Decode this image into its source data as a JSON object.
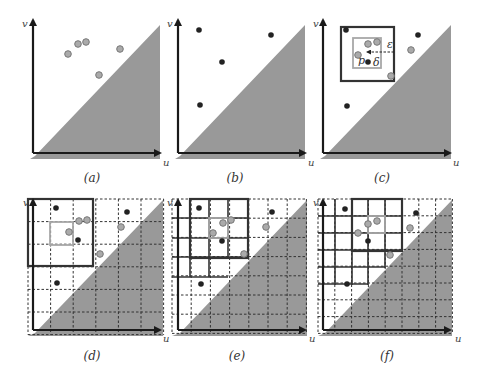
{
  "figure": {
    "colors": {
      "shade": "#999999",
      "axis": "#1a1a1a",
      "black_point": "#222222",
      "gray_point_fill": "#aaaaaa",
      "gray_point_stroke": "#777777",
      "grid_dashed": "#333333",
      "box_dark": "#333333",
      "box_gray": "#a8a8a8"
    },
    "panels": [
      {
        "id": "a",
        "caption": "(a)",
        "caption_pos": [
          92,
          182
        ],
        "origin": [
          33,
          153
        ],
        "x_end": [
          160,
          153
        ],
        "y_end": [
          33,
          20
        ],
        "shade": [
          [
            35,
            156
          ],
          [
            160,
            25
          ],
          [
            160,
            159
          ],
          [
            30,
            159
          ]
        ],
        "u_label": "u",
        "u_pos": [
          163,
          166
        ],
        "v_label": "v",
        "v_pos": [
          22,
          27
        ],
        "points": [
          {
            "x": 68,
            "y": 54,
            "kind": "gray"
          },
          {
            "x": 78,
            "y": 44,
            "kind": "gray"
          },
          {
            "x": 86,
            "y": 42,
            "kind": "gray"
          },
          {
            "x": 120,
            "y": 49,
            "kind": "gray"
          },
          {
            "x": 99,
            "y": 75,
            "kind": "gray"
          }
        ]
      },
      {
        "id": "b",
        "caption": "(b)",
        "caption_pos": [
          235,
          182
        ],
        "origin": [
          178,
          153
        ],
        "x_end": [
          305,
          153
        ],
        "y_end": [
          178,
          20
        ],
        "shade": [
          [
            180,
            156
          ],
          [
            305,
            25
          ],
          [
            305,
            159
          ],
          [
            175,
            159
          ]
        ],
        "u_label": "u",
        "u_pos": [
          308,
          166
        ],
        "v_label": "v",
        "v_pos": [
          167,
          27
        ],
        "points": [
          {
            "x": 199,
            "y": 30,
            "kind": "black"
          },
          {
            "x": 271,
            "y": 35,
            "kind": "black"
          },
          {
            "x": 222,
            "y": 62,
            "kind": "black"
          },
          {
            "x": 200,
            "y": 105,
            "kind": "black"
          }
        ]
      },
      {
        "id": "c",
        "caption": "(c)",
        "caption_pos": [
          382,
          182
        ],
        "origin": [
          323,
          153
        ],
        "x_end": [
          450,
          153
        ],
        "y_end": [
          323,
          20
        ],
        "shade": [
          [
            325,
            156
          ],
          [
            451,
            25
          ],
          [
            451,
            159
          ],
          [
            320,
            159
          ]
        ],
        "u_label": "u",
        "u_pos": [
          453,
          166
        ],
        "v_label": "v",
        "v_pos": [
          313,
          27
        ],
        "boxes": [
          {
            "x1": 341,
            "y1": 27,
            "x2": 394,
            "y2": 81,
            "style": "dark"
          },
          {
            "x1": 353,
            "y1": 38,
            "x2": 381,
            "y2": 68,
            "style": "gray"
          }
        ],
        "arrow": {
          "from": [
            394,
            52
          ],
          "to": [
            367,
            52
          ]
        },
        "annotations": [
          {
            "text": "ε",
            "x": 387,
            "y": 48
          },
          {
            "text": "p",
            "x": 358,
            "y": 64
          },
          {
            "text": "δ",
            "x": 373,
            "y": 66
          }
        ],
        "points": [
          {
            "x": 346,
            "y": 30,
            "kind": "black"
          },
          {
            "x": 368,
            "y": 44,
            "kind": "gray"
          },
          {
            "x": 377,
            "y": 42,
            "kind": "gray"
          },
          {
            "x": 358,
            "y": 55,
            "kind": "gray"
          },
          {
            "x": 368,
            "y": 62,
            "kind": "black"
          },
          {
            "x": 391,
            "y": 76,
            "kind": "gray"
          },
          {
            "x": 418,
            "y": 35,
            "kind": "black"
          },
          {
            "x": 411,
            "y": 50,
            "kind": "gray"
          },
          {
            "x": 347,
            "y": 106,
            "kind": "black"
          }
        ]
      },
      {
        "id": "d",
        "caption": "(d)",
        "caption_pos": [
          92,
          360
        ],
        "origin": [
          33,
          330
        ],
        "x_end": [
          160,
          330
        ],
        "y_end": [
          33,
          200
        ],
        "shade": [
          [
            35,
            333
          ],
          [
            163,
            200
          ],
          [
            163,
            336
          ],
          [
            28,
            336
          ]
        ],
        "grid": {
          "x0": 28,
          "y0": 199,
          "step": 22.6,
          "n": 6
        },
        "u_label": "u",
        "u_pos": [
          163,
          342
        ],
        "v_label": "v",
        "v_pos": [
          23,
          206
        ],
        "solid_lines": [],
        "boxes": [
          {
            "x1": 28,
            "y1": 199,
            "x2": 93,
            "y2": 266,
            "style": "dark"
          },
          {
            "x1": 50,
            "y1": 222,
            "x2": 73,
            "y2": 245,
            "style": "gray"
          }
        ],
        "points": [
          {
            "x": 56,
            "y": 208,
            "kind": "black"
          },
          {
            "x": 79,
            "y": 221,
            "kind": "gray"
          },
          {
            "x": 87,
            "y": 220,
            "kind": "gray"
          },
          {
            "x": 69,
            "y": 232,
            "kind": "gray"
          },
          {
            "x": 78,
            "y": 240,
            "kind": "black"
          },
          {
            "x": 100,
            "y": 254,
            "kind": "gray"
          },
          {
            "x": 127,
            "y": 212,
            "kind": "black"
          },
          {
            "x": 121,
            "y": 227,
            "kind": "gray"
          },
          {
            "x": 57,
            "y": 283,
            "kind": "black"
          }
        ]
      },
      {
        "id": "e",
        "caption": "(e)",
        "caption_pos": [
          237,
          360
        ],
        "origin": [
          178,
          330
        ],
        "x_end": [
          305,
          330
        ],
        "y_end": [
          178,
          200
        ],
        "shade": [
          [
            180,
            333
          ],
          [
            307,
            200
          ],
          [
            307,
            336
          ],
          [
            172,
            336
          ]
        ],
        "grid": {
          "x0": 172,
          "y0": 199,
          "step": 19.2,
          "n": 7
        },
        "u_label": "u",
        "u_pos": [
          309,
          342
        ],
        "v_label": "v",
        "v_pos": [
          167,
          206
        ],
        "solid_lines": [
          [
            190,
            199,
            190,
            277
          ],
          [
            209,
            199,
            209,
            277
          ],
          [
            228,
            199,
            228,
            258
          ],
          [
            248,
            199,
            248,
            258
          ],
          [
            172,
            218,
            248,
            218
          ],
          [
            172,
            238,
            248,
            238
          ],
          [
            172,
            257,
            248,
            257
          ],
          [
            172,
            277,
            228,
            277
          ]
        ],
        "boxes": [
          {
            "x1": 190,
            "y1": 199,
            "x2": 248,
            "y2": 258,
            "style": "dark"
          },
          {
            "x1": 209,
            "y1": 218,
            "x2": 228,
            "y2": 238,
            "style": "gray"
          }
        ],
        "points": [
          {
            "x": 199,
            "y": 208,
            "kind": "black"
          },
          {
            "x": 223,
            "y": 223,
            "kind": "gray"
          },
          {
            "x": 231,
            "y": 220,
            "kind": "gray"
          },
          {
            "x": 213,
            "y": 233,
            "kind": "gray"
          },
          {
            "x": 222,
            "y": 241,
            "kind": "black"
          },
          {
            "x": 244,
            "y": 254,
            "kind": "gray"
          },
          {
            "x": 272,
            "y": 212,
            "kind": "black"
          },
          {
            "x": 266,
            "y": 227,
            "kind": "gray"
          },
          {
            "x": 201,
            "y": 284,
            "kind": "black"
          }
        ]
      },
      {
        "id": "f",
        "caption": "(f)",
        "caption_pos": [
          387,
          360
        ],
        "origin": [
          323,
          330
        ],
        "x_end": [
          450,
          330
        ],
        "y_end": [
          323,
          200
        ],
        "shade": [
          [
            325,
            333
          ],
          [
            452,
            200
          ],
          [
            452,
            336
          ],
          [
            318,
            336
          ]
        ],
        "grid": {
          "x0": 318,
          "y0": 199,
          "step": 16.8,
          "n": 8
        },
        "u_label": "u",
        "u_pos": [
          455,
          342
        ],
        "v_label": "v",
        "v_pos": [
          313,
          206
        ],
        "solid_lines": [
          [
            335,
            199,
            335,
            285
          ],
          [
            352,
            199,
            352,
            285
          ],
          [
            368,
            199,
            368,
            285
          ],
          [
            385,
            199,
            385,
            268
          ],
          [
            402,
            199,
            402,
            251
          ],
          [
            318,
            216,
            402,
            216
          ],
          [
            318,
            233,
            402,
            233
          ],
          [
            318,
            250,
            402,
            250
          ],
          [
            318,
            267,
            385,
            267
          ],
          [
            318,
            284,
            368,
            284
          ]
        ],
        "boxes": [
          {
            "x1": 352,
            "y1": 199,
            "x2": 402,
            "y2": 251,
            "style": "dark"
          },
          {
            "x1": 368,
            "y1": 216,
            "x2": 385,
            "y2": 233,
            "style": "gray"
          }
        ],
        "points": [
          {
            "x": 345,
            "y": 209,
            "kind": "black"
          },
          {
            "x": 368,
            "y": 224,
            "kind": "gray"
          },
          {
            "x": 377,
            "y": 221,
            "kind": "gray"
          },
          {
            "x": 358,
            "y": 233,
            "kind": "gray"
          },
          {
            "x": 368,
            "y": 241,
            "kind": "black"
          },
          {
            "x": 390,
            "y": 255,
            "kind": "gray"
          },
          {
            "x": 416,
            "y": 213,
            "kind": "black"
          },
          {
            "x": 410,
            "y": 228,
            "kind": "gray"
          },
          {
            "x": 347,
            "y": 284,
            "kind": "black"
          }
        ]
      }
    ]
  }
}
